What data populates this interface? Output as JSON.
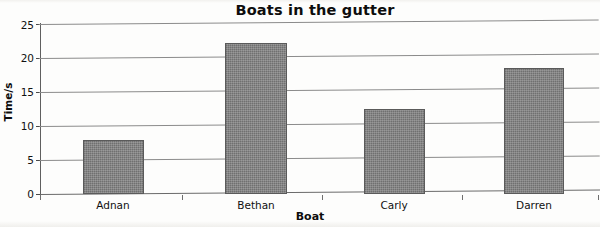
{
  "chart_data": {
    "type": "bar",
    "title": "Boats in the gutter",
    "xlabel": "Boat",
    "ylabel": "Time/s",
    "categories": [
      "Adnan",
      "Bethan",
      "Carly",
      "Darren"
    ],
    "values": [
      8,
      22.2,
      12.5,
      18.5
    ],
    "ylim": [
      0,
      25
    ],
    "ytick_labels": [
      "0",
      "5",
      "10",
      "15",
      "20",
      "25"
    ],
    "ytick_values": [
      0,
      5,
      10,
      15,
      20,
      25
    ],
    "grid": true,
    "legend": false,
    "bar_color": "#7d7d7d",
    "axis_color": "#5f5f5f",
    "gridline_color": "#8b8b8b",
    "background": "#fdfdfc"
  }
}
